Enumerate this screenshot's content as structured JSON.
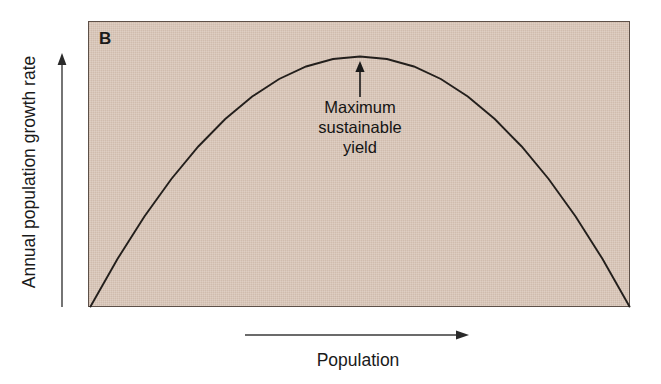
{
  "figure": {
    "panel_label": "B",
    "background_color": "#d9c6b8",
    "page_background": "#ffffff",
    "line_color": "#231f1c",
    "text_color": "#141414"
  },
  "annotation": {
    "line1": "Maximum",
    "line2": "sustainable",
    "line3": "yield",
    "arrow": "up-arrow-icon"
  },
  "axes": {
    "y_label": "Annual population growth rate",
    "y_arrow": "up-arrow-icon",
    "x_label": "Population",
    "x_arrow": "right-arrow-icon"
  },
  "chart_data": {
    "type": "line",
    "title": "",
    "subtitle": "",
    "panel": "B",
    "xlabel": "Population",
    "ylabel": "Annual population growth rate",
    "xlim": [
      0,
      1
    ],
    "ylim": [
      0,
      1
    ],
    "grid": false,
    "legend": false,
    "axis_ticks": {
      "x": [],
      "y": []
    },
    "axis_direction_arrows": {
      "x": "increasing right",
      "y": "increasing up"
    },
    "annotations": [
      {
        "text": "Maximum sustainable yield",
        "points_to_x": 0.5,
        "points_to_y": 1.0,
        "arrow": "up"
      }
    ],
    "series": [
      {
        "name": "Annual population growth rate vs population",
        "shape": "inverted parabola (logistic growth rate curve)",
        "x": [
          0.0,
          0.05,
          0.1,
          0.15,
          0.2,
          0.25,
          0.3,
          0.35,
          0.4,
          0.45,
          0.5,
          0.55,
          0.6,
          0.65,
          0.7,
          0.75,
          0.8,
          0.85,
          0.9,
          0.95,
          1.0
        ],
        "y": [
          0.0,
          0.19,
          0.36,
          0.51,
          0.64,
          0.75,
          0.84,
          0.91,
          0.96,
          0.99,
          1.0,
          0.99,
          0.96,
          0.91,
          0.84,
          0.75,
          0.64,
          0.51,
          0.36,
          0.19,
          0.0
        ]
      }
    ],
    "max_point": {
      "x": 0.5,
      "y": 1.0,
      "label": "Maximum sustainable yield"
    }
  }
}
